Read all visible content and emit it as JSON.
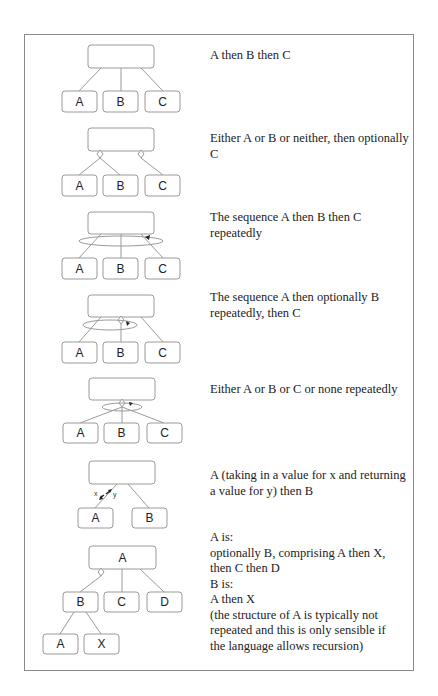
{
  "diagrams": [
    {
      "id": "seq",
      "description": "A then B then C",
      "children": [
        "A",
        "B",
        "C"
      ],
      "root_label": ""
    },
    {
      "id": "sel-opt",
      "description": "Either A or B or neither, then optionally C",
      "children": [
        "A",
        "B",
        "C"
      ],
      "root_label": ""
    },
    {
      "id": "iter-seq",
      "description": "The sequence A then B then C repeatedly",
      "children": [
        "A",
        "B",
        "C"
      ],
      "root_label": ""
    },
    {
      "id": "iter-opt",
      "description": "The sequence A then optionally B repeatedly, then C",
      "children": [
        "A",
        "B",
        "C"
      ],
      "root_label": ""
    },
    {
      "id": "iter-sel",
      "description": "Either A or B or C or none repeatedly",
      "children": [
        "A",
        "B",
        "C"
      ],
      "root_label": ""
    },
    {
      "id": "dataflow",
      "description": "A (taking in a value for x and returning a value for y) then B",
      "children": [
        "A",
        "B"
      ],
      "root_label": "",
      "flow_in": "x",
      "flow_out": "y"
    },
    {
      "id": "recursion",
      "description": "A is:\noptionally B, comprising A then X,\nthen C then D\nB is:\nA then X\n(the structure of A is typically not\nrepeated and this is only sensible if\nthe language allows recursion)",
      "root_label": "A",
      "children": [
        "B",
        "C",
        "D"
      ],
      "grandchildren": [
        "A",
        "X"
      ]
    }
  ],
  "colors": {
    "stroke": "#9a9a9a",
    "frame": "#8a8a8a",
    "text": "#222222"
  }
}
